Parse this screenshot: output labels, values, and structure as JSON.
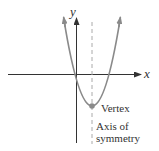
{
  "diagram": {
    "type": "parabola-graph",
    "axes": {
      "x_label": "x",
      "y_label": "y"
    },
    "labels": {
      "vertex": "Vertex",
      "axis_line1": "Axis of",
      "axis_line2": "symmetry"
    },
    "colors": {
      "axis": "#333333",
      "curve": "#8a8a8a",
      "dashed_axis": "#aaaaaa",
      "vertex_dot": "#8a8a8a",
      "text": "#333333"
    }
  }
}
